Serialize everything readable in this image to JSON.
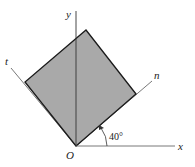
{
  "diagram": {
    "labels": {
      "y_axis": "y",
      "x_axis": "x",
      "t_axis": "t",
      "n_axis": "n",
      "origin": "O",
      "angle": "40°"
    },
    "angle_degrees": 40,
    "colors": {
      "fill": "#a9a9a9",
      "stroke": "#1a1a1a",
      "axis": "#555555",
      "background": "#ffffff"
    }
  }
}
